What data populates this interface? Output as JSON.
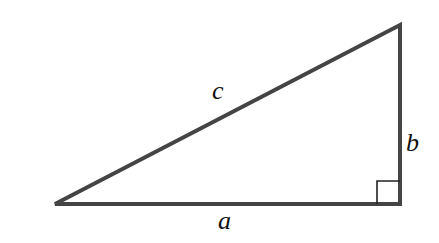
{
  "diagram": {
    "type": "right-triangle",
    "colors": {
      "stroke": "#444444",
      "label": "#111111",
      "background": "#ffffff"
    },
    "vertices": {
      "left": [
        55,
        204
      ],
      "right_angle": [
        400,
        204
      ],
      "top": [
        400,
        25
      ]
    },
    "right_angle_marker": {
      "x": 376,
      "y": 181,
      "size": 23
    },
    "labels": {
      "hypotenuse": "c",
      "vertical_leg": "b",
      "horizontal_leg": "a"
    }
  }
}
